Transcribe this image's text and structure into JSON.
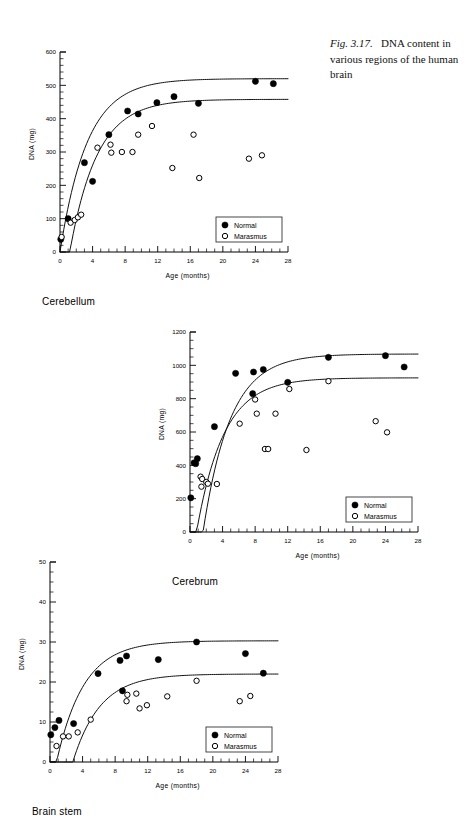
{
  "caption": {
    "fig_number": "Fig. 3.17.",
    "text": "DNA content in various regions of the human brain"
  },
  "legend": {
    "normal": "Normal",
    "marasmus": "Marasmus"
  },
  "axis": {
    "x_title": "Age  (months)",
    "y_title": "DNA  (mg)"
  },
  "panels": [
    {
      "region": "Cerebellum"
    },
    {
      "region": "Cerebrum"
    },
    {
      "region": "Brain stem"
    }
  ],
  "chart_data": [
    {
      "type": "scatter",
      "title": "Cerebellum",
      "xlabel": "Age  (months)",
      "ylabel": "DNA  (mg)",
      "xlim": [
        0,
        28
      ],
      "ylim": [
        0,
        600
      ],
      "xticks": [
        0,
        4,
        8,
        12,
        16,
        20,
        24,
        28
      ],
      "yticks": [
        0,
        100,
        200,
        300,
        400,
        500,
        600
      ],
      "x_minor_step": 1,
      "y_minor_step": 20,
      "grid": false,
      "legend_position": "lower-right",
      "series": [
        {
          "name": "Normal",
          "marker": "filled-circle",
          "points": [
            [
              0.1,
              38
            ],
            [
              1.0,
              100
            ],
            [
              3.0,
              268
            ],
            [
              4.0,
              212
            ],
            [
              6.0,
              352
            ],
            [
              8.3,
              423
            ],
            [
              9.6,
              414
            ],
            [
              11.9,
              448
            ],
            [
              14.0,
              466
            ],
            [
              17.0,
              446
            ],
            [
              24.0,
              512
            ],
            [
              26.2,
              505
            ]
          ]
        },
        {
          "name": "Marasmus",
          "marker": "open-circle",
          "points": [
            [
              0.2,
              45
            ],
            [
              1.3,
              88
            ],
            [
              1.8,
              96
            ],
            [
              2.2,
              104
            ],
            [
              2.6,
              112
            ],
            [
              4.6,
              313
            ],
            [
              6.2,
              322
            ],
            [
              6.3,
              298
            ],
            [
              7.6,
              300
            ],
            [
              8.9,
              300
            ],
            [
              9.6,
              352
            ],
            [
              11.3,
              378
            ],
            [
              13.8,
              252
            ],
            [
              16.4,
              352
            ],
            [
              17.1,
              222
            ],
            [
              23.2,
              280
            ],
            [
              24.8,
              290
            ]
          ]
        }
      ],
      "fitted_curves": [
        {
          "for": "Normal",
          "plateau": 520,
          "x0": 1.2,
          "note": "upper sigmoid"
        },
        {
          "for": "Marasmus",
          "plateau": 458,
          "x0": 2.4,
          "note": "lower sigmoid"
        }
      ]
    },
    {
      "type": "scatter",
      "title": "Cerebrum",
      "xlabel": "Age  (months)",
      "ylabel": "DNA  (mg)",
      "xlim": [
        0,
        28
      ],
      "ylim": [
        0,
        1200
      ],
      "xticks": [
        0,
        4,
        8,
        12,
        16,
        20,
        24,
        28
      ],
      "yticks": [
        0,
        200,
        400,
        600,
        800,
        1000,
        1200
      ],
      "x_minor_step": 1,
      "y_minor_step": 50,
      "grid": false,
      "legend_position": "lower-right",
      "series": [
        {
          "name": "Normal",
          "marker": "filled-circle",
          "points": [
            [
              0.1,
              205
            ],
            [
              0.5,
              415
            ],
            [
              0.7,
              410
            ],
            [
              0.9,
              440
            ],
            [
              3.0,
              632
            ],
            [
              5.6,
              952
            ],
            [
              7.8,
              960
            ],
            [
              9.0,
              975
            ],
            [
              7.7,
              830
            ],
            [
              12.0,
              898
            ],
            [
              17.0,
              1048
            ],
            [
              24.0,
              1058
            ],
            [
              26.3,
              990
            ]
          ]
        },
        {
          "name": "Marasmus",
          "marker": "open-circle",
          "points": [
            [
              1.3,
              332
            ],
            [
              1.5,
              318
            ],
            [
              1.4,
              272
            ],
            [
              2.0,
              300
            ],
            [
              2.2,
              290
            ],
            [
              3.3,
              288
            ],
            [
              6.1,
              650
            ],
            [
              8.0,
              795
            ],
            [
              8.2,
              710
            ],
            [
              10.5,
              710
            ],
            [
              9.2,
              498
            ],
            [
              9.6,
              498
            ],
            [
              12.2,
              858
            ],
            [
              14.3,
              492
            ],
            [
              17.0,
              905
            ],
            [
              22.8,
              665
            ],
            [
              24.2,
              598
            ]
          ]
        }
      ],
      "fitted_curves": [
        {
          "for": "Normal",
          "plateau": 1068,
          "x0": 2.8,
          "note": "upper sigmoid"
        },
        {
          "for": "Marasmus",
          "plateau": 925,
          "x0": 2.0,
          "note": "lower sigmoid"
        }
      ]
    },
    {
      "type": "scatter",
      "title": "Brain stem",
      "xlabel": "Age  (months)",
      "ylabel": "DNA  (mg)",
      "xlim": [
        0,
        28
      ],
      "ylim": [
        0,
        50
      ],
      "xticks": [
        0,
        4,
        8,
        12,
        16,
        20,
        24,
        28
      ],
      "yticks": [
        0,
        10,
        20,
        30,
        40,
        50
      ],
      "x_minor_step": 1,
      "y_minor_step": 2.5,
      "grid": false,
      "legend_position": "lower-right",
      "series": [
        {
          "name": "Normal",
          "marker": "filled-circle",
          "points": [
            [
              0.1,
              6.8
            ],
            [
              0.6,
              8.6
            ],
            [
              1.1,
              10.4
            ],
            [
              2.9,
              9.6
            ],
            [
              5.9,
              22.1
            ],
            [
              8.6,
              25.4
            ],
            [
              9.4,
              26.5
            ],
            [
              8.9,
              17.8
            ],
            [
              13.3,
              25.6
            ],
            [
              18.0,
              30.0
            ],
            [
              24.0,
              27.1
            ],
            [
              26.2,
              22.2
            ]
          ]
        },
        {
          "name": "Marasmus",
          "marker": "open-circle",
          "points": [
            [
              0.8,
              4.0
            ],
            [
              1.6,
              6.4
            ],
            [
              2.3,
              6.4
            ],
            [
              3.4,
              7.4
            ],
            [
              5.0,
              10.6
            ],
            [
              9.4,
              15.2
            ],
            [
              9.5,
              16.8
            ],
            [
              10.6,
              17.1
            ],
            [
              11.0,
              13.4
            ],
            [
              11.9,
              14.2
            ],
            [
              14.4,
              16.4
            ],
            [
              18.0,
              20.3
            ],
            [
              23.3,
              15.2
            ],
            [
              24.6,
              16.5
            ]
          ]
        }
      ],
      "fitted_curves": [
        {
          "for": "Normal",
          "plateau": 30.3,
          "x0": 2.0,
          "note": "upper sigmoid"
        },
        {
          "for": "Marasmus",
          "plateau": 22.0,
          "x0": 4.0,
          "note": "lower sigmoid"
        }
      ]
    }
  ]
}
